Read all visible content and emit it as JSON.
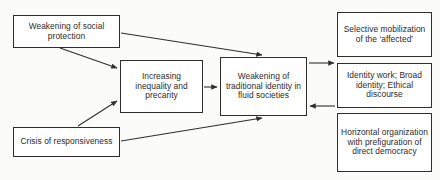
{
  "diagram": {
    "background_color": "#fbfbf9",
    "box_fill_color": "#ffffff",
    "box_border_color": "#2e2e2e",
    "text_color": "#2b2b2b",
    "nodes": [
      {
        "id": "social-protection",
        "label": "Weakening of social protection"
      },
      {
        "id": "inequality",
        "label": "Increasing inequality and precarity"
      },
      {
        "id": "identity",
        "label": "Weakening of traditional identity in fluid societies"
      },
      {
        "id": "responsiveness",
        "label": "Crisis of responsiveness"
      },
      {
        "id": "mobilization",
        "label": "Selective mobilization of the ‘affected’"
      },
      {
        "id": "identity-work",
        "label": "Identity work; Broad identity; Ethical discourse"
      },
      {
        "id": "horizontal",
        "label": "Horizontal organization with prefiguration of direct democracy"
      }
    ],
    "edges": [
      {
        "id": "social-protection-to-inequality",
        "from": "social-protection",
        "to": "inequality",
        "style": "solid-arrow"
      },
      {
        "id": "social-protection-to-identity",
        "from": "social-protection",
        "to": "identity",
        "style": "solid-arrow"
      },
      {
        "id": "responsiveness-to-inequality",
        "from": "responsiveness",
        "to": "inequality",
        "style": "solid-arrow"
      },
      {
        "id": "responsiveness-to-identity",
        "from": "responsiveness",
        "to": "identity",
        "style": "solid-arrow"
      },
      {
        "id": "inequality-to-identity",
        "from": "inequality",
        "to": "identity",
        "style": "solid-arrow"
      },
      {
        "id": "identity-to-identity-work",
        "from": "identity",
        "to": "identity-work",
        "style": "solid-arrow"
      },
      {
        "id": "identity-work-to-identity",
        "from": "identity-work",
        "to": "identity",
        "style": "solid-arrow"
      }
    ]
  }
}
